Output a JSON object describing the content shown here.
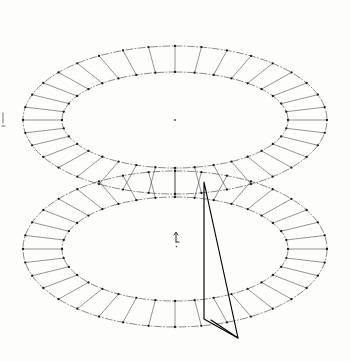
{
  "figure": {
    "width": 350,
    "height": 361,
    "background_color": "#fdfdfc",
    "line_color": "#2b2b2b",
    "overlay_color": "#000000",
    "dot_color": "#1a1a1a"
  },
  "chart_data": {
    "type": "scatter",
    "title": "",
    "subtitle": "",
    "xlabel": "",
    "ylabel": "",
    "grid": false,
    "legend": "none",
    "tori": [
      {
        "name": "upper-torus",
        "center_x": 175,
        "center_y": 120,
        "outer_rx": 152,
        "outer_ry": 74,
        "inner_rx": 113,
        "inner_ry": 48,
        "spoke_count": 36,
        "node_count": 72
      },
      {
        "name": "lower-torus",
        "center_x": 175,
        "center_y": 249,
        "outer_rx": 152,
        "outer_ry": 78,
        "inner_rx": 113,
        "inner_ry": 52,
        "spoke_count": 36,
        "node_count": 72
      }
    ],
    "overlay_triangle": {
      "name": "vector-triangle",
      "vertices": [
        {
          "label": "apex",
          "x": 204,
          "y": 182
        },
        {
          "label": "lower-inner",
          "x": 204,
          "y": 319
        },
        {
          "label": "lower-outer",
          "x": 238,
          "y": 338
        }
      ],
      "extra_segment": {
        "from_x": 211,
        "from_y": 320,
        "to_x": 238,
        "to_y": 338
      }
    },
    "markers": [
      {
        "name": "upper-center-dot",
        "x": 175,
        "y": 120,
        "r": 0.9
      },
      {
        "name": "lower-center-axis",
        "x": 176,
        "y": 240,
        "type": "axis-arrow"
      },
      {
        "name": "left-edge-tick",
        "x": 3,
        "y": 118,
        "type": "tick"
      }
    ]
  },
  "labels": {
    "upper_torus": "Upper toroidal ring",
    "lower_torus": "Lower toroidal ring",
    "triangle": "Overlay triangle",
    "center_marker": "Center reference point",
    "axis_marker": "Axis direction marker",
    "edge_tick": "Left edge reference tick"
  }
}
